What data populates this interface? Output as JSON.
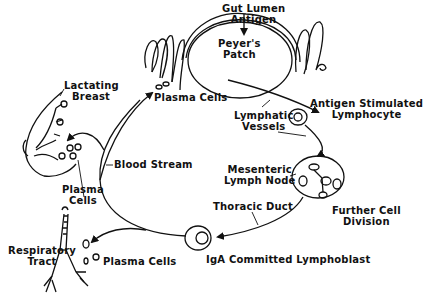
{
  "diagram": {
    "labels": {
      "gut_lumen_antigen": [
        "Gut Lumen",
        "Antigen"
      ],
      "peyers_patch": [
        "Peyer's",
        "Patch"
      ],
      "plasma_cells_gut": "Plasma Cells",
      "lymphatic_vessels": [
        "Lymphatic",
        "Vessels"
      ],
      "antigen_stimulated_lymphocyte": [
        "Antigen Stimulated",
        "Lymphocyte"
      ],
      "mesenteric_lymph_node": [
        "Mesenteric",
        "Lymph Node"
      ],
      "further_cell_division": [
        "Further Cell",
        "Division"
      ],
      "thoracic_duct": "Thoracic Duct",
      "iga_committed_lymphoblast": "IgA Committed Lymphoblast",
      "blood_stream": "Blood Stream",
      "lactating_breast": [
        "Lactating",
        "Breast"
      ],
      "plasma_cells_breast": [
        "Plasma",
        "Cells"
      ],
      "respiratory_tract": [
        "Respiratory",
        "Tract"
      ],
      "plasma_cells_resp": "Plasma Cells"
    },
    "stroke_color": "#111111",
    "background": "#ffffff"
  }
}
